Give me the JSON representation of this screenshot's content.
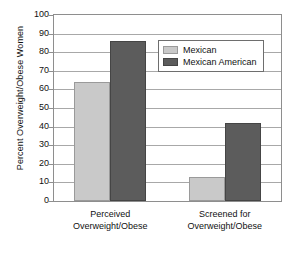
{
  "chart_data": {
    "type": "bar",
    "title": "",
    "xlabel": "",
    "ylabel": "Percent Overweight/Obese Women",
    "ylim": [
      0,
      100
    ],
    "ytick_labels": [
      "100",
      "90",
      "80",
      "70",
      "60",
      "50",
      "40",
      "30",
      "20",
      "10",
      "0"
    ],
    "ytick_values": [
      100,
      90,
      80,
      70,
      60,
      50,
      40,
      30,
      20,
      10,
      0
    ],
    "grid": true,
    "legend_position": "upper right",
    "categories": [
      "Perceived Overweight/Obese",
      "Screened for Overweight/Obese"
    ],
    "category_lines": [
      [
        "Perceived",
        "Overweight/Obese"
      ],
      [
        "Screened for",
        "Overweight/Obese"
      ]
    ],
    "series": [
      {
        "name": "Mexican",
        "color": "#c9c9c9",
        "values": [
          64,
          13
        ]
      },
      {
        "name": "Mexican American",
        "color": "#5c5c5c",
        "values": [
          86,
          42
        ]
      }
    ]
  },
  "legend": {
    "items": [
      {
        "label": "Mexican"
      },
      {
        "label": "Mexican American"
      }
    ]
  }
}
